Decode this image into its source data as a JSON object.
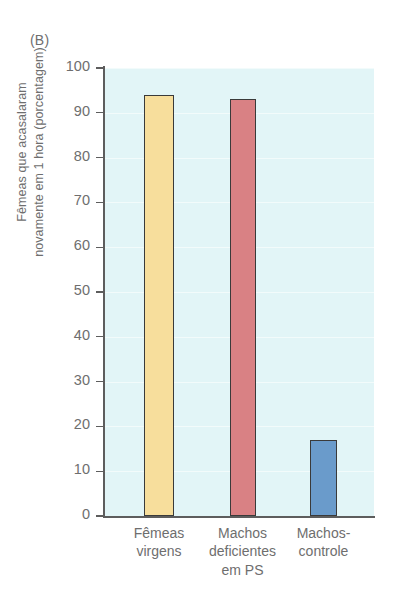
{
  "panel": {
    "label": "(B)"
  },
  "colors": {
    "plot_background": "#e2f5f7",
    "axis": "#5d5d5d",
    "text": "#6e6e6e",
    "bar_outline": "#3a3a3a",
    "bar_yellow": "#f7de9c",
    "bar_salmon": "#d98184",
    "bar_blue": "#6a9bcb"
  },
  "chart_data": {
    "type": "bar",
    "title": "(B)",
    "xlabel": "",
    "ylabel": "Fêmeas que acasalaram novamente em 1 hora (porcentagem)",
    "ylabel_lines": [
      "Fêmeas que acasalaram",
      "novamente em 1 hora (porcentagem)"
    ],
    "categories": [
      "Fêmeas\nvirgens",
      "Machos\ndeficientes\nem PS",
      "Machos-\ncontrole"
    ],
    "categories_flat": [
      "Fêmeas virgens",
      "Machos deficientes em PS",
      "Machos-controle"
    ],
    "values": [
      94,
      93,
      17
    ],
    "bar_colors": [
      "#f7de9c",
      "#d98184",
      "#6a9bcb"
    ],
    "ylim": [
      0,
      100
    ],
    "ytick_values": [
      100,
      90,
      80,
      70,
      60,
      50,
      40,
      30,
      20,
      10,
      0
    ],
    "ytick_labels": [
      "100",
      "90",
      "80",
      "70",
      "60",
      "50",
      "40",
      "30",
      "20",
      "10",
      "0"
    ],
    "grid": false,
    "legend": "none"
  }
}
